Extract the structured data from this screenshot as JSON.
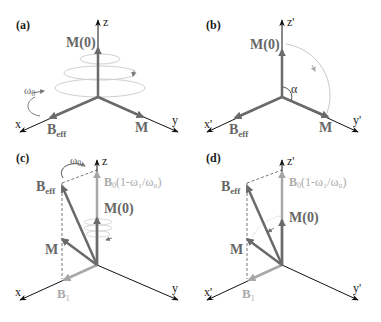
{
  "figure": {
    "panels": [
      {
        "id": "a",
        "label": "(a)",
        "axes": {
          "x": "x",
          "y": "y",
          "z": "z"
        },
        "vectors": {
          "M0": "M(0)",
          "Beff_main": "B",
          "Beff_sub": "eff",
          "M": "M"
        },
        "rotation": {
          "main": "ω",
          "sub": "0"
        }
      },
      {
        "id": "b",
        "label": "(b)",
        "axes": {
          "x": "x'",
          "y": "y'",
          "z": "z'"
        },
        "vectors": {
          "M0": "M(0)",
          "Beff_main": "B",
          "Beff_sub": "eff",
          "M": "M"
        },
        "angle": "α"
      },
      {
        "id": "c",
        "label": "(c)",
        "axes": {
          "x": "x",
          "y": "y",
          "z": "z"
        },
        "vectors": {
          "M0": "M(0)",
          "Beff_main": "B",
          "Beff_sub": "eff",
          "M": "M",
          "B1_main": "B",
          "B1_sub": "1",
          "B0_main": "B",
          "B0_sub": "0",
          "B0_expr": "(1-ω₁/ω₀)"
        },
        "rotation": {
          "main": "ω",
          "sub": "0"
        }
      },
      {
        "id": "d",
        "label": "(d)",
        "axes": {
          "x": "x'",
          "y": "y'",
          "z": "z'"
        },
        "vectors": {
          "M0": "M(0)",
          "Beff_main": "B",
          "Beff_sub": "eff",
          "M": "M",
          "B1_main": "B",
          "B1_sub": "1",
          "B0_main": "B",
          "B0_sub": "0",
          "B0_expr": "(1-ω₁/ω₀)"
        }
      }
    ],
    "colors": {
      "axis": "#1a1a1a",
      "vector_dark": "#666666",
      "vector_light": "#a8a8a8",
      "precession": "#c8c8c8",
      "dashed": "#555555"
    }
  }
}
